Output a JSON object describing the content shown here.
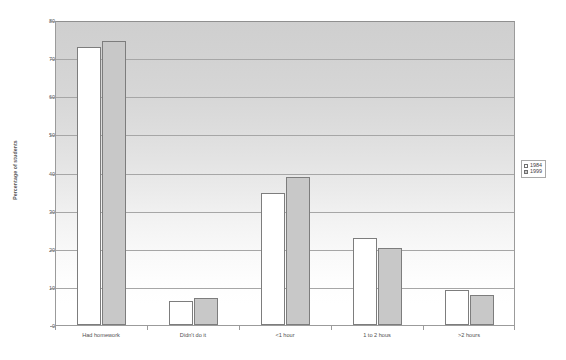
{
  "chart_data": {
    "type": "bar",
    "title": "",
    "xlabel": "",
    "ylabel": "Percentage of students",
    "ylim": [
      0,
      80
    ],
    "ytick_step": 10,
    "yticks": [
      0,
      10,
      20,
      30,
      40,
      50,
      60,
      70,
      80
    ],
    "grid": true,
    "legend_position": "right",
    "categories": [
      "Had homework",
      "Didn't do it",
      "<1 hour",
      "1 to 2 hous",
      ">2 hours"
    ],
    "series": [
      {
        "name": "1984",
        "color": "#ffffff",
        "values": [
          73.0,
          6.2,
          34.5,
          22.8,
          9.2
        ]
      },
      {
        "name": "1999",
        "color": "#c8c8c8",
        "values": [
          74.5,
          7.0,
          38.8,
          20.3,
          8.0
        ]
      }
    ]
  },
  "legend": {
    "entries": [
      {
        "label": "1984",
        "swatch": "legend-swatch-1984"
      },
      {
        "label": "1999",
        "swatch": "legend-swatch-1999"
      }
    ]
  }
}
